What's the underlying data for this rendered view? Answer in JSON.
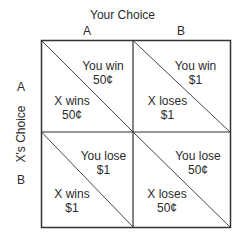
{
  "title": "Your Choice",
  "columns": [
    "A",
    "B"
  ],
  "row_axis_label": "X's Choice",
  "rows": [
    "A",
    "B"
  ],
  "cells": [
    [
      {
        "you": "You win",
        "you_amount": "50¢",
        "x": "X wins",
        "x_amount": "50¢"
      },
      {
        "you": "You win",
        "you_amount": "$1",
        "x": "X loses",
        "x_amount": "$1"
      }
    ],
    [
      {
        "you": "You lose",
        "you_amount": "$1",
        "x": "X wins",
        "x_amount": "$1"
      },
      {
        "you": "You lose",
        "you_amount": "50¢",
        "x": "X loses",
        "x_amount": "50¢"
      }
    ]
  ],
  "colors": {
    "line": "#333333",
    "text": "#2a2a2a",
    "background": "#ffffff"
  }
}
